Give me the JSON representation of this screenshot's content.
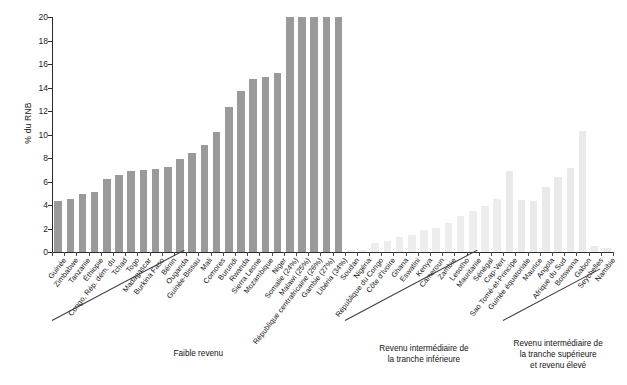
{
  "chart_data": {
    "type": "bar",
    "title": "",
    "xlabel": "",
    "ylabel": "% du RNB",
    "ylim": [
      0,
      20
    ],
    "yticks": [
      0,
      2,
      4,
      6,
      8,
      10,
      12,
      14,
      16,
      18,
      20
    ],
    "grid": false,
    "legend": null,
    "bar_color_low": "#9a9a9a",
    "bar_color_mid": "#ededed",
    "bar_color_high": "#eaeaea",
    "note": "Bars exceeding the 20% axis limit are clipped and their true value is given in parentheses in the category label.",
    "categories": [
      "Guinée",
      "Zimbabwe",
      "Tanzanie",
      "Éthiopie",
      "Congo, Rép. dém. du",
      "Tchad",
      "Togo",
      "Madagascar",
      "Burkina Faso",
      "Bénin",
      "Ouganda",
      "Guinée-Bissau",
      "Mali",
      "Comores",
      "Burundi",
      "Rwanda",
      "Sierra Leone",
      "Mozambique",
      "Niger",
      "Somalie (24%)",
      "Malawi (25%)",
      "République centrafricaine (26%)",
      "Gambie (27%)",
      "Libéria (34%)",
      "Soudan",
      "Nigéria",
      "République du Congo",
      "Côte d'Ivoire",
      "Ghana",
      "Eswatini",
      "Kenya",
      "Cameroun",
      "Zambie",
      "Lesotho",
      "Mauritanie",
      "Sénégal",
      "Cap-Vert",
      "Sao Tomé-et-Principe",
      "Guinée équatoriale",
      "Maurice",
      "Angola",
      "Afrique du Sud",
      "Botswana",
      "Gabon",
      "Seychelles",
      "Namibie"
    ],
    "values": [
      4.35,
      4.55,
      4.95,
      5.1,
      6.25,
      6.55,
      6.9,
      6.95,
      7.05,
      7.25,
      7.95,
      8.4,
      9.1,
      10.2,
      12.35,
      13.7,
      14.7,
      14.9,
      15.2,
      20,
      20,
      20,
      20,
      20,
      0.15,
      0.2,
      0.75,
      0.95,
      1.3,
      1.45,
      1.85,
      2.05,
      2.45,
      3.1,
      3.45,
      3.95,
      4.55,
      6.9,
      4.4,
      4.3,
      5.55,
      6.4,
      7.15,
      10.3,
      0.5,
      0.35
    ],
    "groups": [
      {
        "label": "Faible revenu",
        "start": 0,
        "end": 23
      },
      {
        "label": "Revenu intermédiaire de\nla tranche inférieure",
        "start": 24,
        "end": 36
      },
      {
        "label": "Revenu intermédiaire de\nla tranche supérieure\net revenu élevé",
        "start": 37,
        "end": 45
      }
    ]
  }
}
